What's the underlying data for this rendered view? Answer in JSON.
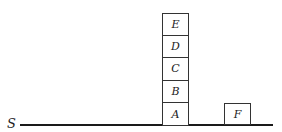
{
  "diagram": {
    "surface_label": "S",
    "stack": {
      "blocks_top_to_bottom": [
        "E",
        "D",
        "C",
        "B",
        "A"
      ]
    },
    "separate_block": "F"
  }
}
